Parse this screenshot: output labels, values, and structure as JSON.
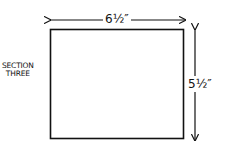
{
  "diagram": {
    "section_label_line1": "SECTION",
    "section_label_line2": "THREE",
    "width_label": "6½″",
    "height_label": "5½″",
    "colors": {
      "stroke": "#111111",
      "background": "#ffffff"
    }
  }
}
